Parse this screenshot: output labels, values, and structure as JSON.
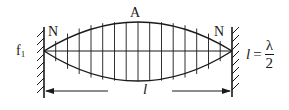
{
  "diagram": {
    "colors": {
      "stroke": "#1a1a1a",
      "background": "#ffffff"
    },
    "labels": {
      "left_node": "N",
      "right_node": "N",
      "antinode": "A",
      "frequency_symbol": "f",
      "frequency_subscript": "1",
      "length_symbol": "l",
      "formula": {
        "lhs": "l",
        "equals": "=",
        "numerator": "λ",
        "denominator": "2"
      }
    },
    "geometry": {
      "left_wall_x": 44,
      "right_wall_x": 232,
      "wall_top_y": 27,
      "wall_bottom_y": 98,
      "axis_y": 51,
      "envelope_top_y": 22,
      "envelope_bottom_y": 81,
      "dimension_y": 91,
      "vertical_line_count": 15
    }
  }
}
